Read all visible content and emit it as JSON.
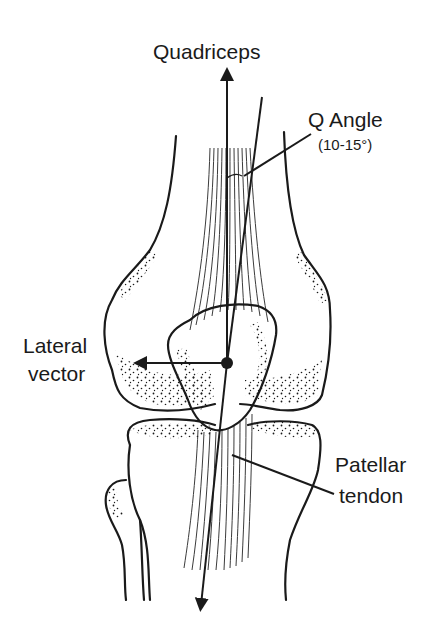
{
  "diagram": {
    "labels": {
      "quadriceps": "Quadriceps",
      "q_angle": "Q Angle",
      "q_angle_range": "(10-15°)",
      "lateral_vector_line1": "Lateral",
      "lateral_vector_line2": "vector",
      "patellar_tendon_line1": "Patellar",
      "patellar_tendon_line2": "tendon"
    },
    "colors": {
      "ink": "#1a1a1a",
      "background": "#ffffff"
    }
  }
}
